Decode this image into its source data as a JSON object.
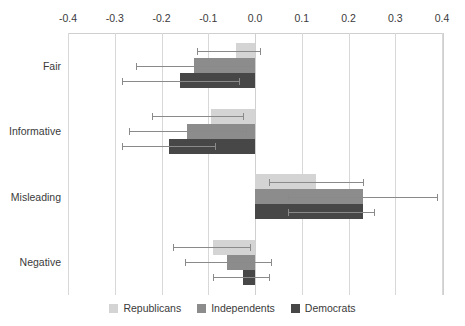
{
  "chart_data": {
    "type": "bar",
    "orientation": "horizontal",
    "title": "",
    "subtitle": "",
    "xlabel": "",
    "ylabel": "",
    "xlim": [
      -0.4,
      0.4
    ],
    "xticks": [
      -0.4,
      -0.3,
      -0.2,
      -0.1,
      0.0,
      0.1,
      0.2,
      0.3,
      0.4
    ],
    "xticklabels": [
      "-0.4",
      "-0.3",
      "-0.2",
      "-0.1",
      "0.0",
      "0.1",
      "0.2",
      "0.3",
      "0.4"
    ],
    "categories": [
      "Fair",
      "Informative",
      "Misleading",
      "Negative"
    ],
    "grid": true,
    "grid_axis": "x",
    "legend_position": "bottom",
    "zero_reference": 0.0,
    "error_bars": true,
    "series": [
      {
        "name": "Republicans",
        "color": "#d4d4d4",
        "values": [
          -0.04,
          -0.095,
          0.13,
          -0.09
        ],
        "err_low": [
          -0.125,
          -0.22,
          0.03,
          -0.175
        ],
        "err_high": [
          0.01,
          -0.025,
          0.23,
          -0.01
        ]
      },
      {
        "name": "Independents",
        "color": "#8c8c8c",
        "values": [
          -0.13,
          -0.145,
          0.23,
          -0.06
        ],
        "err_low": [
          -0.255,
          -0.27,
          0.07,
          -0.15
        ],
        "err_high": [
          -0.005,
          -0.02,
          0.39,
          0.035
        ]
      },
      {
        "name": "Democrats",
        "color": "#474747",
        "values": [
          -0.16,
          -0.185,
          0.23,
          -0.025
        ],
        "err_low": [
          -0.285,
          -0.285,
          0.07,
          -0.09
        ],
        "err_high": [
          -0.035,
          -0.085,
          0.255,
          0.03
        ]
      }
    ]
  },
  "legend": {
    "items": [
      {
        "label": "Republicans",
        "color": "#d4d4d4"
      },
      {
        "label": "Independents",
        "color": "#8c8c8c"
      },
      {
        "label": "Democrats",
        "color": "#474747"
      }
    ]
  }
}
